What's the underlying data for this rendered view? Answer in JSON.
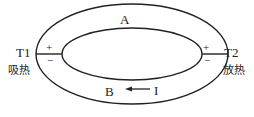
{
  "diagram": {
    "outer_label_top": "A",
    "outer_label_bottom": "B",
    "current_label": "I",
    "left_junction": {
      "temperature": "T1",
      "heat": "吸热",
      "plus": "+",
      "minus": "−"
    },
    "right_junction": {
      "temperature": "T2",
      "heat": "放热",
      "plus": "+",
      "minus": "−"
    },
    "colors": {
      "line": "#222222",
      "background": "#ffffff"
    }
  }
}
